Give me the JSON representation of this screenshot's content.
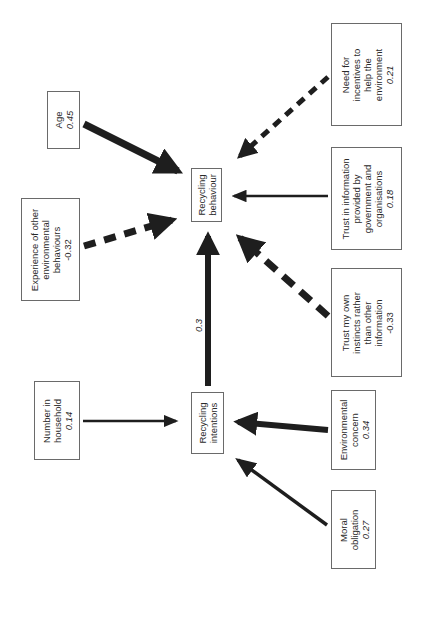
{
  "diagram": {
    "orientation": "rotated-90-ccw",
    "colors": {
      "arrow": "#1e1e1e",
      "box_border": "#6a6a6a",
      "text": "#2a2a2a"
    },
    "central_nodes": {
      "behaviour": {
        "lines": [
          "Recycling",
          "behaviour"
        ]
      },
      "intentions": {
        "lines": [
          "Recycling",
          "intentions"
        ]
      }
    },
    "predictors": {
      "age": {
        "lines": [
          "Age"
        ],
        "value": "0.45",
        "target": "behaviour",
        "line": "solid"
      },
      "experience": {
        "lines": [
          "Experience of other",
          "environmental",
          "behaviours"
        ],
        "value": "-0.32",
        "target": "behaviour",
        "line": "dashed"
      },
      "incentives": {
        "lines": [
          "Need for",
          "incentives to",
          "help the",
          "environment"
        ],
        "value": "0.21",
        "target": "behaviour",
        "line": "dashed"
      },
      "trust_info": {
        "lines": [
          "Trust in information",
          "provided by",
          "government and",
          "organisations"
        ],
        "value": "0.18",
        "target": "behaviour",
        "line": "solid"
      },
      "trust_instincts": {
        "lines": [
          "Trust my own",
          "instincts rather",
          "than other",
          "information"
        ],
        "value": "-0.33",
        "target": "behaviour",
        "line": "dashed"
      },
      "household": {
        "lines": [
          "Number in",
          "household"
        ],
        "value": "0.14",
        "target": "intentions",
        "line": "solid"
      },
      "env_concern": {
        "lines": [
          "Environmental",
          "concern"
        ],
        "value": "0.34",
        "target": "intentions",
        "line": "solid"
      },
      "moral": {
        "lines": [
          "Moral",
          "obligation"
        ],
        "value": "0.27",
        "target": "intentions",
        "line": "solid"
      }
    },
    "paths": {
      "intentions_to_behaviour": {
        "value": "0.3",
        "line": "solid"
      }
    }
  }
}
